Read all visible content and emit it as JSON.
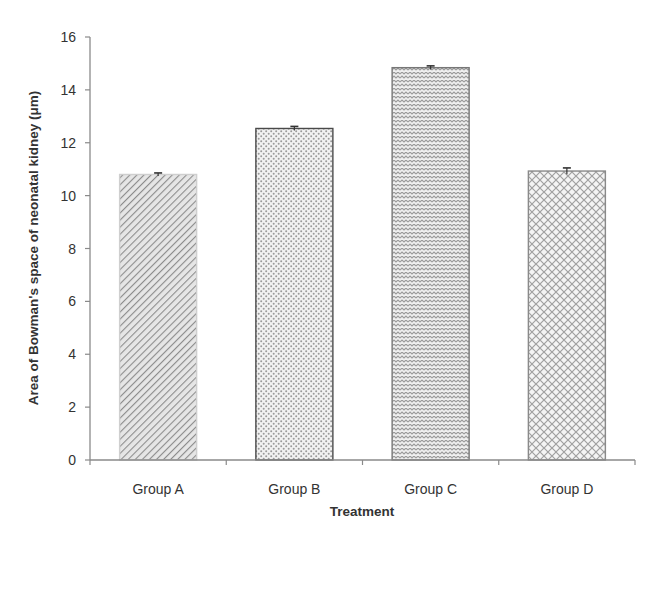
{
  "chart_data": {
    "type": "bar",
    "title": "",
    "xlabel": "Treatment",
    "ylabel": "Area of Bowman's space of neonatal kidney (μm)",
    "categories": [
      "Group A",
      "Group B",
      "Group C",
      "Group D"
    ],
    "values": [
      10.8,
      12.54,
      14.84,
      10.93
    ],
    "error_bars": [
      0.02,
      0.04,
      0.03,
      0.08
    ],
    "ylim": [
      0,
      16
    ],
    "yticks": [
      0,
      2,
      4,
      6,
      8,
      10,
      12,
      14,
      16
    ],
    "grid": false,
    "legend": null,
    "patterns": [
      "diagonal-lines",
      "dots",
      "zigzag",
      "crosshatch-diamond"
    ]
  },
  "colors": {
    "axis": "#8a8a8a",
    "bar_stroke": "#555555",
    "pattern": "#8c8c8c"
  }
}
